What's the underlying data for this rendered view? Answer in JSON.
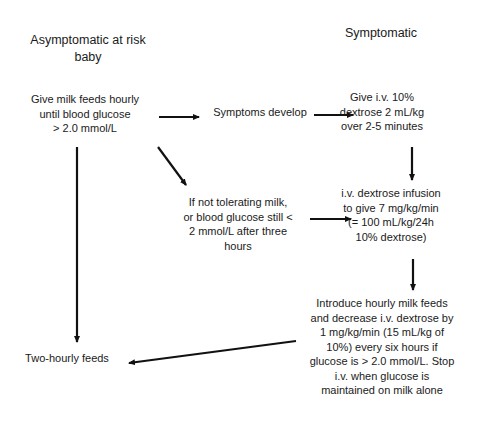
{
  "headers": {
    "left": [
      "Asymptomatic at risk",
      "baby"
    ],
    "right": [
      "Symptomatic"
    ]
  },
  "nodes": {
    "milk_feeds": [
      "Give milk feeds hourly",
      "until blood glucose",
      "> 2.0 mmol/L"
    ],
    "symptoms_develop": [
      "Symptoms develop"
    ],
    "bolus": [
      "Give i.v. 10%",
      "dextrose 2 mL/kg",
      "over 2-5 minutes"
    ],
    "not_tolerating": [
      "If not tolerating milk,",
      "or blood glucose still <",
      "2 mmol/L after three",
      "hours"
    ],
    "infusion": [
      "i.v. dextrose infusion",
      "to give 7 mg/kg/min",
      "(= 100 mL/kg/24h",
      "10% dextrose)"
    ],
    "wean": [
      "Introduce hourly milk feeds",
      "and decrease i.v. dextrose by",
      "1 mg/kg/min (15 mL/kg of",
      "10%) every six hours if",
      "glucose is > 2.0 mmol/L. Stop",
      "i.v. when glucose is",
      "maintained on milk alone"
    ],
    "two_hourly": [
      "Two-hourly feeds"
    ]
  },
  "edges": [
    {
      "from": "milk_feeds",
      "to": "symptoms_develop"
    },
    {
      "from": "symptoms_develop",
      "to": "bolus"
    },
    {
      "from": "milk_feeds",
      "to": "not_tolerating"
    },
    {
      "from": "bolus",
      "to": "infusion"
    },
    {
      "from": "not_tolerating",
      "to": "infusion"
    },
    {
      "from": "infusion",
      "to": "wean"
    },
    {
      "from": "milk_feeds",
      "to": "two_hourly"
    },
    {
      "from": "wean",
      "to": "two_hourly"
    }
  ],
  "colors": {
    "arrow": "#111111",
    "text": "#1a1a1a",
    "background": "#ffffff"
  }
}
